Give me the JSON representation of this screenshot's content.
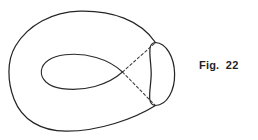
{
  "page": {
    "width": 258,
    "height": 140,
    "background_color": "#ffffff"
  },
  "caption": {
    "text": "Fig.  22",
    "label_prefix": "Fig.",
    "figure_number": "22",
    "color": "#1f1f1f"
  },
  "figure": {
    "line_color": "#252525",
    "dashed_line_color": "#3a3a3a",
    "parts": [
      {
        "name": "outer-body-outline",
        "style": "solid",
        "path": "M 155.5 42.5 C 140 20 112 10.5 80 11.2 C 52 12 28 25 15.5 46 C 6.5 61 7.5 82 14 99 C 22 120 41 131 66 131.2 C 98 131.4 134 119 155.5 105.5"
      },
      {
        "name": "cross-section-ellipse",
        "style": "solid",
        "path": "M 155.5 42.5 C 166 42.8 174.2 57 174.6 73.6 C 175 90.5 167 105.2 155.5 105.5 C 145.5 105.2 151.2 88 151.2 73.6 C 151.2 59 146 42.8 155.5 42.5 Z"
      },
      {
        "name": "inner-hole-upper-curve",
        "style": "solid",
        "path": "M 122.5 72.0 C 108 58.5 86 52.5 65 54.8 C 51 56.4 42.5 62.5 41.4 70.5"
      },
      {
        "name": "inner-hole-lower-curve",
        "style": "solid",
        "path": "M 41.4 70.5 C 40.4 79.5 48.5 86.8 62 88.6 C 84 91.5 107.5 85.5 122.5 72.0"
      },
      {
        "name": "dashed-line-upper",
        "style": "dashed",
        "path": "M 122.5 72.0 L 155.0 43.0"
      },
      {
        "name": "dashed-line-lower",
        "style": "dashed",
        "path": "M 122.5 72.0 L 155.0 105.2"
      }
    ]
  }
}
